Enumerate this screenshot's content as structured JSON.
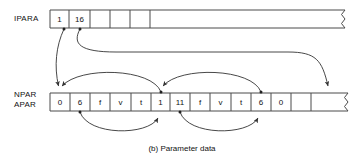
{
  "figure": {
    "caption": "(b)  Parameter data",
    "colors": {
      "stroke": "#4a4a4a",
      "arrow": "#333333",
      "text": "#111111",
      "background": "#ffffff"
    }
  },
  "arrays": [
    {
      "id": "ipara",
      "label": "IPARA",
      "label_lines": [
        "IPARA"
      ],
      "cells": [
        "1",
        "16",
        "",
        "",
        "",
        ""
      ],
      "truncated": true
    },
    {
      "id": "npar-apar",
      "label": "NPAR APAR",
      "label_lines": [
        "NPAR",
        "APAR"
      ],
      "cells": [
        "0",
        "6",
        "f",
        "v",
        "t",
        "1",
        "11",
        "f",
        "v",
        "t",
        "6",
        "0",
        "",
        ""
      ],
      "truncated": true
    }
  ],
  "pointers": [
    {
      "id": "ipara-1-to-npar-0",
      "from": "ipara.cell.0",
      "to": "npar-apar.cell.0"
    },
    {
      "id": "ipara-16-to-npar-tail",
      "from": "ipara.cell.1",
      "to": "npar-apar.cell.13"
    },
    {
      "id": "npar-1-back-to-0",
      "from": "npar-apar.cell.5",
      "to": "npar-apar.cell.0"
    },
    {
      "id": "npar-6-forward-to-1",
      "from": "npar-apar.cell.10",
      "to": "npar-apar.cell.5"
    },
    {
      "id": "npar-6-lower-to-1",
      "from": "npar-apar.cell.1",
      "to": "npar-apar.cell.5"
    },
    {
      "id": "npar-11-lower-to-6",
      "from": "npar-apar.cell.6",
      "to": "npar-apar.cell.10"
    }
  ]
}
